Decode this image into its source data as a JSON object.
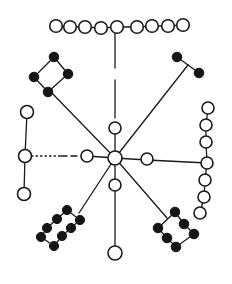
{
  "diagram": {
    "type": "network",
    "colors": {
      "ink": "#1a1a1a",
      "filled": "#151515",
      "background": "#ffffff"
    },
    "hub": {
      "x": 115,
      "y": 158,
      "r": 7
    },
    "spokes": [
      {
        "id": "up",
        "path": [
          [
            115,
            158
          ],
          [
            115,
            128
          ],
          [
            115,
            32
          ]
        ],
        "style": "dashed-gap"
      },
      {
        "id": "up-left",
        "path": [
          [
            115,
            158
          ],
          [
            49,
            90
          ]
        ]
      },
      {
        "id": "up-right",
        "path": [
          [
            115,
            158
          ],
          [
            188,
            65
          ]
        ]
      },
      {
        "id": "left",
        "path": [
          [
            115,
            158
          ],
          [
            87,
            156
          ],
          [
            25,
            156
          ]
        ],
        "style": "dashed"
      },
      {
        "id": "right",
        "path": [
          [
            115,
            158
          ],
          [
            147,
            160
          ],
          [
            207,
            163
          ]
        ]
      },
      {
        "id": "down",
        "path": [
          [
            115,
            158
          ],
          [
            115,
            185
          ],
          [
            115,
            253
          ]
        ]
      },
      {
        "id": "down-left",
        "path": [
          [
            115,
            158
          ],
          [
            79,
            213
          ]
        ]
      },
      {
        "id": "down-right",
        "path": [
          [
            115,
            158
          ],
          [
            167,
            218
          ]
        ]
      }
    ],
    "nodes": {
      "inner_open": [
        {
          "x": 115,
          "y": 128,
          "r": 6
        },
        {
          "x": 87,
          "y": 156,
          "r": 6
        },
        {
          "x": 147,
          "y": 159,
          "r": 6
        },
        {
          "x": 115,
          "y": 185,
          "r": 6
        },
        {
          "x": 115,
          "y": 253,
          "r": 7
        }
      ],
      "top_chain_open": [
        {
          "x": 56,
          "y": 26
        },
        {
          "x": 70,
          "y": 27
        },
        {
          "x": 85,
          "y": 27
        },
        {
          "x": 101,
          "y": 28
        },
        {
          "x": 117,
          "y": 27
        },
        {
          "x": 137,
          "y": 27
        },
        {
          "x": 152,
          "y": 26
        },
        {
          "x": 168,
          "y": 26
        },
        {
          "x": 183,
          "y": 25
        }
      ],
      "left_chain_open": [
        {
          "x": 27,
          "y": 112
        },
        {
          "x": 25,
          "y": 156
        },
        {
          "x": 24,
          "y": 194
        }
      ],
      "right_chain_open": [
        {
          "x": 208,
          "y": 108
        },
        {
          "x": 206,
          "y": 125
        },
        {
          "x": 206,
          "y": 142
        },
        {
          "x": 207,
          "y": 163
        },
        {
          "x": 205,
          "y": 180
        },
        {
          "x": 204,
          "y": 197
        },
        {
          "x": 200,
          "y": 213
        }
      ],
      "upper_left_ring_filled": [
        {
          "x": 54,
          "y": 57
        },
        {
          "x": 68,
          "y": 74
        },
        {
          "x": 48,
          "y": 92
        },
        {
          "x": 34,
          "y": 77
        }
      ],
      "upper_right_pair_filled": [
        {
          "x": 177,
          "y": 57
        },
        {
          "x": 199,
          "y": 73
        }
      ],
      "lower_left_ladder_filled": [
        {
          "x": 67,
          "y": 210
        },
        {
          "x": 57,
          "y": 219
        },
        {
          "x": 47,
          "y": 228
        },
        {
          "x": 41,
          "y": 237
        },
        {
          "x": 54,
          "y": 246
        },
        {
          "x": 62,
          "y": 236
        },
        {
          "x": 71,
          "y": 228
        },
        {
          "x": 80,
          "y": 220
        }
      ],
      "lower_right_ring_filled": [
        {
          "x": 175,
          "y": 212
        },
        {
          "x": 184,
          "y": 224
        },
        {
          "x": 194,
          "y": 234
        },
        {
          "x": 176,
          "y": 247
        },
        {
          "x": 167,
          "y": 238
        },
        {
          "x": 158,
          "y": 228
        }
      ]
    },
    "counts": {
      "top_chain": 9,
      "left_chain": 3,
      "right_chain": 7,
      "upper_left_ring": 4,
      "upper_right_pair": 2,
      "lower_left_ladder": 8,
      "lower_right_ring": 6
    }
  }
}
